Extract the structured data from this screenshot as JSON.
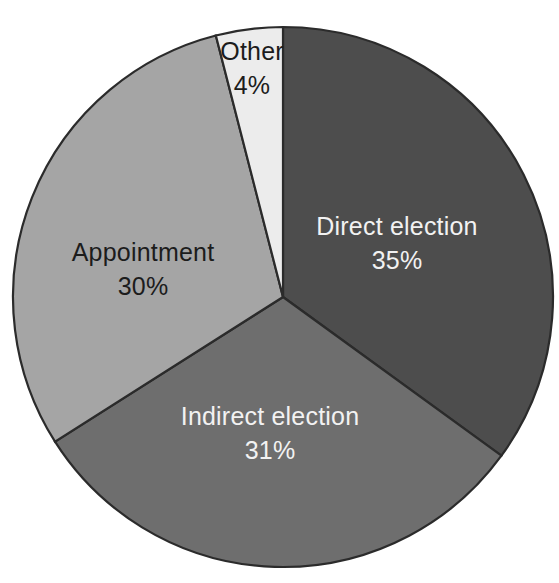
{
  "chart_data": {
    "type": "pie",
    "title": "",
    "subtitle": "",
    "xlabel": "",
    "ylabel": "",
    "legend_position": "none",
    "grid": false,
    "units": "percent",
    "start_angle_deg": 0,
    "direction": "clockwise",
    "categories": [
      "Direct election",
      "Indirect election",
      "Appointment",
      "Other"
    ],
    "values": [
      35,
      31,
      30,
      4
    ],
    "value_labels": [
      "35%",
      "31%",
      "30%",
      "4%"
    ],
    "colors": [
      "#4d4d4d",
      "#6e6e6e",
      "#a5a5a5",
      "#ececec"
    ],
    "slices": [
      {
        "name": "Direct election",
        "value": 35,
        "value_label": "35%",
        "color": "#4d4d4d",
        "start_deg": 0,
        "end_deg": 126,
        "label_fill": "#f2f2f2"
      },
      {
        "name": "Indirect election",
        "value": 31,
        "value_label": "31%",
        "color": "#6e6e6e",
        "start_deg": 126,
        "end_deg": 237.6,
        "label_fill": "#f2f2f2"
      },
      {
        "name": "Appointment",
        "value": 30,
        "value_label": "30%",
        "color": "#a5a5a5",
        "start_deg": 237.6,
        "end_deg": 345.6,
        "label_fill": "#1c1c1c"
      },
      {
        "name": "Other",
        "value": 4,
        "value_label": "4%",
        "color": "#ececec",
        "start_deg": 345.6,
        "end_deg": 360,
        "label_fill": "#1c1c1c"
      }
    ]
  },
  "figure": {
    "background_color": "#ffffff",
    "outline_color": "#2b2b2b",
    "center_x": 283,
    "center_y": 297,
    "radius": 270
  },
  "labels": {
    "direct_election": {
      "name": "Direct election",
      "value_label": "35%",
      "x": 397,
      "y": 228
    },
    "indirect_election": {
      "name": "Indirect election",
      "value_label": "31%",
      "x": 270,
      "y": 418
    },
    "appointment": {
      "name": "Appointment",
      "value_label": "30%",
      "x": 143,
      "y": 254
    },
    "other": {
      "name": "Other",
      "value_label": "4%",
      "x": 252,
      "y": 53
    }
  }
}
